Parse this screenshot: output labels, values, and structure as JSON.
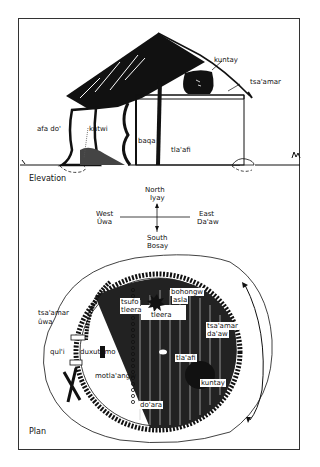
{
  "elevation": {
    "section_label": "Elevation",
    "labels": {
      "kuntay": "kuntay",
      "tsa_amar": "tsa'amar",
      "afa_do": "afa do'",
      "kutwi": "kutwi",
      "baqa": "baqa",
      "tla_afi": "tla'afi"
    }
  },
  "compass": {
    "north": "North",
    "north_local": "Iyay",
    "south": "South",
    "south_local": "Bosay",
    "west": "West",
    "west_local": "Ûwa",
    "east": "East",
    "east_local": "Da'aw"
  },
  "plan": {
    "section_label": "Plan",
    "labels": {
      "bohongw_asla_1": "bohongw",
      "bohongw_asla_2": "asla",
      "tsufo_tleera_1": "tsufo",
      "tsufo_tleera_2": "tleera",
      "tleera": "tleera",
      "tsa_amar_uwa_1": "tsa'amar",
      "tsa_amar_uwa_2": "ûwa",
      "tsa_amar_daaw_1": "tsa'amar",
      "tsa_amar_daaw_2": "da'aw",
      "tla_afi": "tla'afi",
      "qul_i": "qul'i",
      "duxutamo": "duxutamo",
      "motla_angw": "motla'angw",
      "kuntay": "kuntay",
      "do_ara": "do'ara"
    }
  }
}
